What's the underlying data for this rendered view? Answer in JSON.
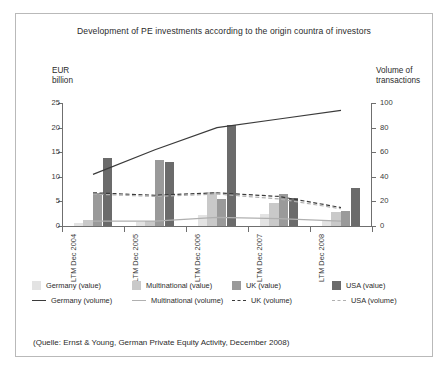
{
  "figure": {
    "title": "Development of PE investments according to the origin countra of investors",
    "source_note": "(Quelle: Ernst & Young, German Private Equity Activity, December 2008)"
  },
  "axes": {
    "left_caption_line1": "EUR",
    "left_caption_line2": "billion",
    "right_caption_line1": "Volume of",
    "right_caption_line2": "transactions",
    "left_ticks": [
      "0",
      "5",
      "10",
      "15",
      "20",
      "25"
    ],
    "right_ticks": [
      "0",
      "20",
      "40",
      "60",
      "80",
      "100"
    ]
  },
  "legend": {
    "columns": [
      {
        "value_label": "Germany (value)",
        "value_color": "#e3e3e3",
        "volume_label": "Germany (volume)",
        "volume_color": "#3b3b3b",
        "volume_style": "solid"
      },
      {
        "value_label": "Multinational (value)",
        "value_color": "#c9c9c9",
        "volume_label": "Multinational (volume)",
        "volume_color": "#b0b0b0",
        "volume_style": "solid"
      },
      {
        "value_label": "UK (value)",
        "value_color": "#9a9a9a",
        "volume_label": "UK (volume)",
        "volume_color": "#3b3b3b",
        "volume_style": "dashed"
      },
      {
        "value_label": "USA (value)",
        "value_color": "#6b6b6b",
        "volume_label": "USA (volume)",
        "volume_color": "#b0b0b0",
        "volume_style": "dashed"
      }
    ]
  },
  "chart_data": {
    "type": "bar",
    "title": "Development of PE investments according to the origin countra of investors",
    "xlabel": "",
    "ylabel": "EUR billion",
    "y2label": "Volume of transactions",
    "ylim": [
      0,
      25
    ],
    "y2lim": [
      0,
      100
    ],
    "grid": false,
    "legend_position": "bottom",
    "categories": [
      "LTM Dec 2004",
      "LTM Dec 2005",
      "LTM Dec 2006",
      "LTM Dec 2007",
      "LTM Dec 2008"
    ],
    "series": [
      {
        "name": "Germany (value)",
        "axis": "left",
        "type": "bar",
        "color": "#e3e3e3",
        "values": [
          0.7,
          0.8,
          2.2,
          2.5,
          1.0
        ]
      },
      {
        "name": "Multinational (value)",
        "axis": "left",
        "type": "bar",
        "color": "#c9c9c9",
        "values": [
          1.3,
          1.1,
          7.0,
          4.6,
          2.8
        ]
      },
      {
        "name": "UK (value)",
        "axis": "left",
        "type": "bar",
        "color": "#9a9a9a",
        "values": [
          6.8,
          13.5,
          5.5,
          6.5,
          3.0
        ]
      },
      {
        "name": "USA (value)",
        "axis": "left",
        "type": "bar",
        "color": "#6b6b6b",
        "values": [
          13.8,
          13.1,
          20.5,
          5.6,
          7.7
        ]
      },
      {
        "name": "Germany (volume)",
        "axis": "right",
        "type": "line",
        "color": "#3b3b3b",
        "style": "solid",
        "values": [
          42,
          62,
          80,
          87,
          94
        ]
      },
      {
        "name": "Multinational (volume)",
        "axis": "right",
        "type": "line",
        "color": "#b0b0b0",
        "style": "solid",
        "values": [
          4,
          4,
          7,
          6,
          4
        ]
      },
      {
        "name": "UK (volume)",
        "axis": "right",
        "type": "line",
        "color": "#3b3b3b",
        "style": "dashed",
        "values": [
          27,
          25,
          27,
          24,
          15
        ]
      },
      {
        "name": "USA (volume)",
        "axis": "right",
        "type": "line",
        "color": "#b0b0b0",
        "style": "dashed",
        "values": [
          26,
          24,
          26,
          22,
          14
        ]
      }
    ]
  }
}
